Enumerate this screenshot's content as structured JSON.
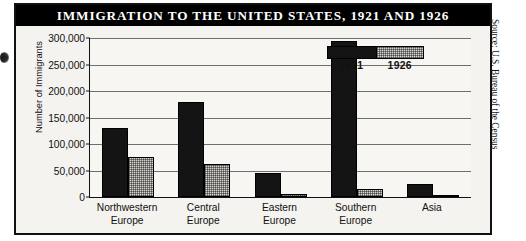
{
  "figure": {
    "title": "IMMIGRATION TO THE UNITED STATES, 1921 AND 1926",
    "source_credit": "Source: U.S. Bureau of the Census"
  },
  "chart_data": {
    "type": "bar",
    "title": "IMMIGRATION TO THE UNITED STATES, 1921 AND 1926",
    "xlabel": "",
    "ylabel": "Number of Immigrants",
    "ylim": [
      0,
      300000
    ],
    "yticks": [
      0,
      50000,
      100000,
      150000,
      200000,
      250000,
      300000
    ],
    "ytick_labels": [
      "0",
      "50,000",
      "100,000",
      "150,000",
      "200,000",
      "250,000",
      "300,000"
    ],
    "grid": true,
    "legend_position": "top-right",
    "categories": [
      "Northwestern\nEurope",
      "Central\nEurope",
      "Eastern\nEurope",
      "Southern\nEurope",
      "Asia"
    ],
    "category_labels": [
      {
        "line1": "Northwestern",
        "line2": "Europe"
      },
      {
        "line1": "Central",
        "line2": "Europe"
      },
      {
        "line1": "Eastern",
        "line2": "Europe"
      },
      {
        "line1": "Southern",
        "line2": "Europe"
      },
      {
        "line1": "Asia",
        "line2": ""
      }
    ],
    "series": [
      {
        "name": "1921",
        "color": "#141414",
        "values": [
          130000,
          180000,
          45000,
          295000,
          25000
        ]
      },
      {
        "name": "1926",
        "color": "#d6d5d0",
        "values": [
          75000,
          62000,
          5000,
          15000,
          2000
        ]
      }
    ]
  }
}
